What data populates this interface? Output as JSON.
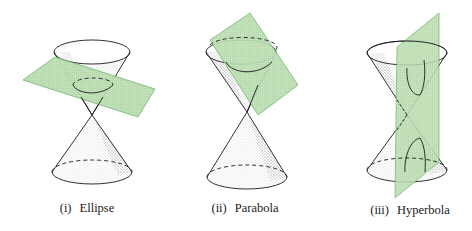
{
  "figure": {
    "panels": [
      {
        "id": "ellipse",
        "numeral": "(i)",
        "name": "Ellipse",
        "plane": "tilted plane cutting one nappe"
      },
      {
        "id": "parabola",
        "numeral": "(ii)",
        "name": "Parabola",
        "plane": "plane parallel to cone side"
      },
      {
        "id": "hyperbola",
        "numeral": "(iii)",
        "name": "Hyperbola",
        "plane": "vertical plane cutting both nappes"
      }
    ],
    "colors": {
      "plane_fill": "#b9dcb0",
      "plane_edge": "#6fae6a",
      "outline": "#1a1a1a",
      "background": "#ffffff"
    }
  }
}
